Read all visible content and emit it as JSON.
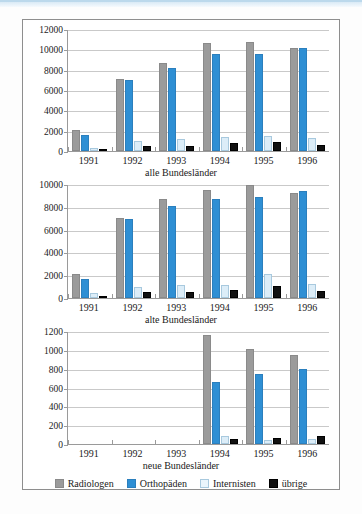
{
  "figure": {
    "background_color": "#ffffff",
    "border_color": "#8e8e8e",
    "top_band_color": "#cfe4f2"
  },
  "legend": {
    "position": "bottom-center",
    "items": [
      {
        "label": "Radiologen",
        "color": "#9b9b9b",
        "key": "radiologen"
      },
      {
        "label": "Orthopäden",
        "color": "#2e8fd4",
        "key": "orthopaeden"
      },
      {
        "label": "Internisten",
        "color": "#dcedf8",
        "key": "internisten"
      },
      {
        "label": "übrige",
        "color": "#111111",
        "key": "uebrige"
      }
    ]
  },
  "chart_data": [
    {
      "type": "bar",
      "title": "",
      "xlabel": "alle Bundesländer",
      "ylabel": "",
      "categories": [
        "1991",
        "1992",
        "1993",
        "1994",
        "1995",
        "1996"
      ],
      "ylim": [
        0,
        12000
      ],
      "yticks": [
        0,
        2000,
        4000,
        6000,
        8000,
        10000,
        12000
      ],
      "ytick_labels": [
        "0",
        "2000",
        "4000",
        "6000",
        "8000",
        "10000",
        "12000"
      ],
      "grid": true,
      "series": [
        {
          "name": "Radiologen",
          "color": "#9b9b9b",
          "values": [
            2050,
            7100,
            8650,
            10600,
            10750,
            10150
          ]
        },
        {
          "name": "Orthopäden",
          "color": "#2e8fd4",
          "values": [
            1620,
            6950,
            8200,
            9500,
            9550,
            10100
          ]
        },
        {
          "name": "Internisten",
          "color": "#dcedf8",
          "values": [
            330,
            980,
            1180,
            1380,
            1430,
            1280
          ]
        },
        {
          "name": "übrige",
          "color": "#111111",
          "values": [
            140,
            450,
            500,
            780,
            880,
            600
          ]
        }
      ]
    },
    {
      "type": "bar",
      "title": "",
      "xlabel": "alte Bundesländer",
      "ylabel": "",
      "categories": [
        "1991",
        "1992",
        "1993",
        "1994",
        "1995",
        "1996"
      ],
      "ylim": [
        0,
        10000
      ],
      "yticks": [
        0,
        2000,
        4000,
        6000,
        8000,
        10000
      ],
      "ytick_labels": [
        "0",
        "2000",
        "4000",
        "6000",
        "8000",
        "10000"
      ],
      "grid": true,
      "series": [
        {
          "name": "Radiologen",
          "color": "#9b9b9b",
          "values": [
            2080,
            7030,
            8650,
            9480,
            9900,
            9200
          ]
        },
        {
          "name": "Orthopäden",
          "color": "#2e8fd4",
          "values": [
            1630,
            6930,
            8100,
            8700,
            8850,
            9350
          ]
        },
        {
          "name": "Internisten",
          "color": "#dcedf8",
          "values": [
            400,
            930,
            1130,
            1150,
            2080,
            1230
          ]
        },
        {
          "name": "übrige",
          "color": "#111111",
          "values": [
            120,
            540,
            500,
            700,
            1050,
            580
          ]
        }
      ]
    },
    {
      "type": "bar",
      "title": "",
      "xlabel": "neue Bundesländer",
      "ylabel": "",
      "categories": [
        "1991",
        "1992",
        "1993",
        "1994",
        "1995",
        "1996"
      ],
      "ylim": [
        0,
        1200
      ],
      "yticks": [
        0,
        200,
        400,
        600,
        800,
        1000,
        1200
      ],
      "ytick_labels": [
        "0",
        "200",
        "400",
        "600",
        "800",
        "1000",
        "1200"
      ],
      "grid": true,
      "series": [
        {
          "name": "Radiologen",
          "color": "#9b9b9b",
          "values": [
            0,
            0,
            0,
            1160,
            1005,
            945
          ]
        },
        {
          "name": "Orthopäden",
          "color": "#2e8fd4",
          "values": [
            0,
            0,
            0,
            660,
            740,
            800
          ]
        },
        {
          "name": "Internisten",
          "color": "#dcedf8",
          "values": [
            0,
            0,
            0,
            85,
            40,
            55
          ]
        },
        {
          "name": "übrige",
          "color": "#111111",
          "values": [
            0,
            0,
            0,
            50,
            60,
            85
          ]
        }
      ]
    }
  ]
}
